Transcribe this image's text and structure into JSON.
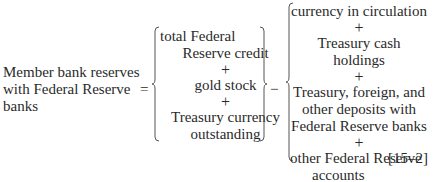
{
  "equation": {
    "lhs_lines": [
      "Member bank reserves",
      "with Federal Reserve",
      "banks"
    ],
    "equals": "=",
    "minus": "−",
    "group1": {
      "items": [
        [
          "total Federal",
          "Reserve credit"
        ],
        [
          "gold stock"
        ],
        [
          "Treasury currency",
          "outstanding"
        ]
      ],
      "operator": "+"
    },
    "group2": {
      "items": [
        [
          "currency in circulation"
        ],
        [
          "Treasury cash holdings"
        ],
        [
          "Treasury, foreign, and",
          "other deposits with",
          "Federal Reserve banks"
        ],
        [
          "other Federal Reserve",
          "accounts"
        ]
      ],
      "operator": "+"
    },
    "number": "[15–2]"
  }
}
